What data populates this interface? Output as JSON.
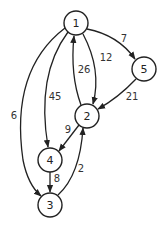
{
  "graph": {
    "nodes": [
      {
        "id": "1",
        "label": "1",
        "x": 76,
        "y": 23
      },
      {
        "id": "5",
        "label": "5",
        "x": 144,
        "y": 69
      },
      {
        "id": "2",
        "label": "2",
        "x": 87,
        "y": 116
      },
      {
        "id": "4",
        "label": "4",
        "x": 50,
        "y": 160
      },
      {
        "id": "3",
        "label": "3",
        "x": 50,
        "y": 205
      }
    ],
    "edges": [
      {
        "from": "1",
        "to": "5",
        "weight": "7"
      },
      {
        "from": "1",
        "to": "2",
        "weight": "12"
      },
      {
        "from": "2",
        "to": "1",
        "weight": "26"
      },
      {
        "from": "5",
        "to": "2",
        "weight": "21"
      },
      {
        "from": "1",
        "to": "4",
        "weight": "45"
      },
      {
        "from": "1",
        "to": "3",
        "weight": "6"
      },
      {
        "from": "2",
        "to": "4",
        "weight": "9"
      },
      {
        "from": "4",
        "to": "3",
        "weight": "8"
      },
      {
        "from": "3",
        "to": "2",
        "weight": "2"
      }
    ]
  }
}
